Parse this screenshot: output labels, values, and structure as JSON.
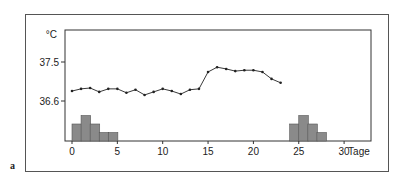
{
  "figure_label": "a",
  "chart_data": {
    "type": "line",
    "title": "",
    "xlabel": "Tage",
    "ylabel": "°C",
    "x_ticks": [
      0,
      5,
      10,
      15,
      20,
      25,
      30
    ],
    "y_ticks": [
      36.6,
      37.5
    ],
    "xlim": [
      0,
      31
    ],
    "grid": false,
    "series": [
      {
        "name": "Basaltemperatur",
        "x": [
          0,
          1,
          2,
          3,
          4,
          5,
          6,
          7,
          8,
          9,
          10,
          11,
          12,
          13,
          14,
          15,
          16,
          17,
          18,
          19,
          20,
          21,
          22,
          23
        ],
        "values": [
          36.83,
          36.88,
          36.9,
          36.81,
          36.88,
          36.88,
          36.79,
          36.86,
          36.74,
          36.81,
          36.88,
          36.83,
          36.76,
          36.86,
          36.88,
          37.27,
          37.38,
          37.34,
          37.29,
          37.31,
          37.31,
          37.27,
          37.11,
          37.02
        ]
      }
    ],
    "bars": [
      {
        "name": "Menstruation 1",
        "x_start": 0,
        "widths": [
          1,
          1,
          1,
          1,
          1
        ],
        "heights": [
          2,
          3,
          2,
          1,
          1
        ],
        "x": [
          0,
          1,
          2,
          3,
          4
        ]
      },
      {
        "name": "Menstruation 2",
        "x_start": 24,
        "heights": [
          2,
          3,
          2,
          1
        ],
        "x": [
          24,
          25,
          26,
          27
        ]
      }
    ],
    "bar_color": "#8a8a8a",
    "line_color": "#222222"
  }
}
